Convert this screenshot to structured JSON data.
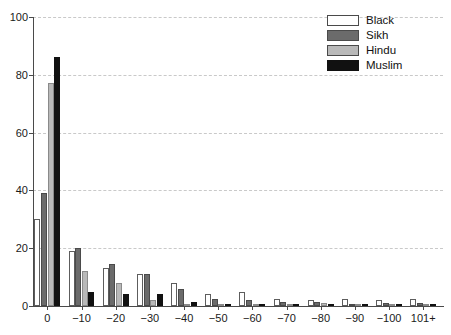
{
  "chart_data": {
    "type": "bar",
    "title": "",
    "subtitle": "",
    "xlabel": "",
    "ylabel": "",
    "ylim": [
      0,
      100
    ],
    "yticks": [
      0,
      20,
      40,
      60,
      80,
      100
    ],
    "ytick_labels": [
      "0",
      "20",
      "40",
      "60",
      "80",
      "100"
    ],
    "grid": "horizontal-dashed",
    "legend_position": "top-right",
    "categories": [
      "0",
      "−10",
      "−20",
      "−30",
      "−40",
      "−50",
      "−60",
      "−70",
      "−80",
      "−90",
      "−100",
      "101+"
    ],
    "series": [
      {
        "name": "Black",
        "color": "#ffffff",
        "values": [
          30,
          19,
          13,
          11,
          8,
          4,
          5,
          2.5,
          2,
          2.5,
          2,
          2.5
        ]
      },
      {
        "name": "Sikh",
        "color": "#6b6b6b",
        "values": [
          39,
          20,
          14.5,
          11,
          6,
          2.5,
          2,
          1.5,
          1.5,
          0.5,
          1.2,
          1.2
        ]
      },
      {
        "name": "Hindu",
        "color": "#b9b9b9",
        "values": [
          77,
          12,
          8,
          2,
          0.5,
          0.3,
          0.5,
          0.3,
          1,
          0.2,
          0.3,
          0.3
        ]
      },
      {
        "name": "Muslim",
        "color": "#111111",
        "values": [
          86,
          5,
          4,
          4,
          1.5,
          0.2,
          0.2,
          0.2,
          0.2,
          0.1,
          0.1,
          0.1
        ]
      }
    ]
  },
  "legend": {
    "items": [
      {
        "label": "Black",
        "swatch": "s-black"
      },
      {
        "label": "Sikh",
        "swatch": "s-sikh"
      },
      {
        "label": "Hindu",
        "swatch": "s-hindu"
      },
      {
        "label": "Muslim",
        "swatch": "s-muslim"
      }
    ]
  }
}
